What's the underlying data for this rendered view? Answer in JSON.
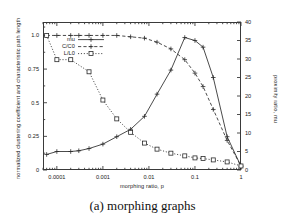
{
  "caption": "(a) morphing graphs",
  "chart_data": {
    "type": "line",
    "title": "",
    "xlabel": "morphing ratio, p",
    "ylabel": "normalized clustering coefficient and characteristic path length",
    "ylabel_right": "proximity ratio, mu",
    "xscale": "log",
    "xlim": [
      5e-05,
      1.0
    ],
    "ylim": [
      0,
      1.1
    ],
    "ylim_right": [
      0,
      40
    ],
    "grid": false,
    "legend_position": "upper-left-inside",
    "xticks": [
      "0.0001",
      "0.001",
      "0.01",
      "0.1",
      "1"
    ],
    "xtick_values": [
      0.0001,
      0.001,
      0.01,
      0.1,
      1
    ],
    "yticks_left": [
      "0",
      "0.25",
      "0.5",
      "0.75",
      "1.0"
    ],
    "ytick_values_left": [
      0,
      0.25,
      0.5,
      0.75,
      1.0
    ],
    "yticks_right": [
      "0",
      "5",
      "10",
      "15",
      "20",
      "25",
      "30",
      "35",
      "40"
    ],
    "ytick_values_right": [
      0,
      5,
      10,
      15,
      20,
      25,
      30,
      35,
      40
    ],
    "series": [
      {
        "name": "mu",
        "axis": "right",
        "marker": "plus",
        "linestyle": "solid",
        "color": "#2b2b2b",
        "x": [
          6e-05,
          0.0001,
          0.0002,
          0.0003,
          0.0005,
          0.001,
          0.002,
          0.004,
          0.008,
          0.015,
          0.03,
          0.06,
          0.1,
          0.15,
          0.25,
          0.5,
          1.0
        ],
        "y": [
          4.2,
          5.0,
          5.0,
          5.2,
          5.8,
          7.0,
          9.0,
          11.0,
          14.5,
          20.5,
          27.0,
          35.8,
          35.0,
          33.2,
          25.0,
          9.0,
          1.0
        ]
      },
      {
        "name": "C/C0",
        "axis": "left",
        "marker": "plus",
        "linestyle": "dashed",
        "color": "#2b2b2b",
        "x": [
          6e-05,
          0.0001,
          0.0002,
          0.0003,
          0.0005,
          0.001,
          0.002,
          0.004,
          0.008,
          0.015,
          0.03,
          0.06,
          0.1,
          0.15,
          0.25,
          0.5,
          1.0
        ],
        "y": [
          1.0,
          1.0,
          1.0,
          1.0,
          1.0,
          1.0,
          1.0,
          0.99,
          0.98,
          0.95,
          0.9,
          0.82,
          0.72,
          0.62,
          0.45,
          0.22,
          0.03
        ]
      },
      {
        "name": "L/L0",
        "axis": "left",
        "marker": "square",
        "linestyle": "dotted",
        "color": "#2b2b2b",
        "x": [
          6e-05,
          0.0001,
          0.0002,
          0.0005,
          0.001,
          0.002,
          0.004,
          0.008,
          0.015,
          0.03,
          0.06,
          0.1,
          0.15,
          0.25,
          0.5,
          1.0
        ],
        "y": [
          1.0,
          0.82,
          0.82,
          0.73,
          0.52,
          0.38,
          0.28,
          0.2,
          0.155,
          0.125,
          0.105,
          0.09,
          0.085,
          0.075,
          0.06,
          0.03
        ]
      }
    ]
  },
  "legend": {
    "items": [
      {
        "label": "mu"
      },
      {
        "label": "C/C0"
      },
      {
        "label": "L/L0"
      }
    ]
  }
}
